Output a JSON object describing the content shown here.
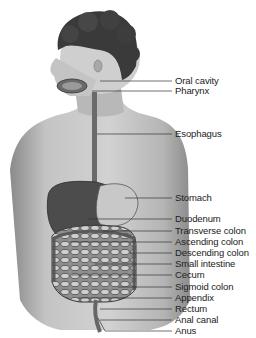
{
  "figure": {
    "labels": [
      {
        "text": "Oral cavity",
        "y": 81,
        "line_x_start": 100
      },
      {
        "text": "Pharynx",
        "y": 91,
        "line_x_start": 92
      },
      {
        "text": "Esophagus",
        "y": 134,
        "line_x_start": 97
      },
      {
        "text": "Stomach",
        "y": 198,
        "line_x_start": 125
      },
      {
        "text": "Duodenum",
        "y": 219,
        "line_x_start": 88
      },
      {
        "text": "Transverse colon",
        "y": 231,
        "line_x_start": 103
      },
      {
        "text": "Ascending colon",
        "y": 242,
        "line_x_start": 70
      },
      {
        "text": "Descending colon",
        "y": 253,
        "line_x_start": 130
      },
      {
        "text": "Small intestine",
        "y": 264,
        "line_x_start": 95
      },
      {
        "text": "Cecum",
        "y": 275,
        "line_x_start": 72
      },
      {
        "text": "Sigmoid colon",
        "y": 287,
        "line_x_start": 118
      },
      {
        "text": "Appendix",
        "y": 298,
        "line_x_start": 78
      },
      {
        "text": "Rectum",
        "y": 309,
        "line_x_start": 100
      },
      {
        "text": "Anal canal",
        "y": 320,
        "line_x_start": 100
      },
      {
        "text": "Anus",
        "y": 331,
        "line_x_start": 105
      }
    ]
  }
}
